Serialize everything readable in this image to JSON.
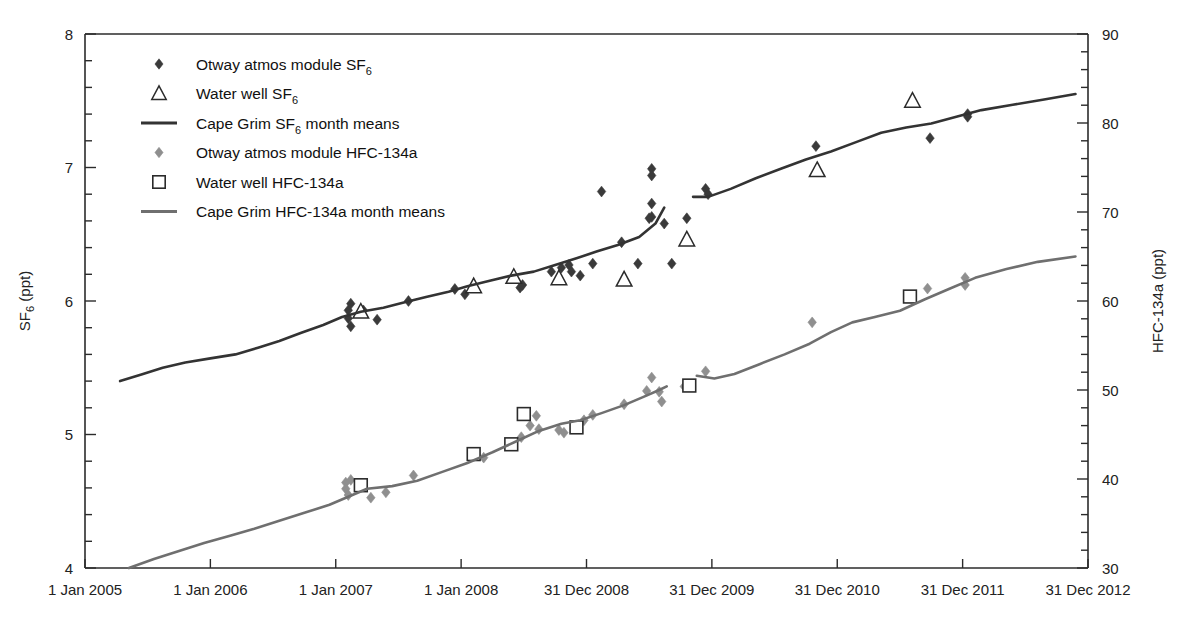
{
  "chart_data": {
    "type": "scatter",
    "title": "",
    "xlabel": "",
    "ylabel": "SF_6 (ppt)",
    "y2label": "HFC-134a (ppt)",
    "grid": false,
    "legend_position": "top-left-inside",
    "x_axis": {
      "tick_labels": [
        "1 Jan 2005",
        "1 Jan 2006",
        "1 Jan 2007",
        "1 Jan 2008",
        "31 Dec 2008",
        "31 Dec 2009",
        "31 Dec 2010",
        "31 Dec 2011",
        "31 Dec 2012"
      ],
      "tick_values": [
        2005.0,
        2006.0,
        2007.0,
        2008.0,
        2009.0,
        2010.0,
        2011.0,
        2012.0,
        2013.0
      ],
      "range": [
        2005.0,
        2013.0
      ]
    },
    "y_left": {
      "label": "SF6 (ppt)",
      "label_main": "SF",
      "label_sub": "6",
      "label_unit": " (ppt)",
      "range": [
        4,
        8
      ],
      "major_ticks": [
        4,
        5,
        6,
        7,
        8
      ],
      "major_tick_labels": [
        "4",
        "5",
        "6",
        "7",
        "8"
      ],
      "minor_tick_step": 0.2
    },
    "y_right": {
      "label": "HFC-134a (ppt)",
      "range": [
        30,
        90
      ],
      "major_ticks": [
        30,
        40,
        50,
        60,
        70,
        80,
        90
      ],
      "major_tick_labels": [
        "30",
        "40",
        "50",
        "60",
        "70",
        "80",
        "90"
      ],
      "minor_tick_step": 2
    },
    "colors": {
      "sf6_dark": "#3a3a3a",
      "hfc_gray": "#8a8a8a",
      "axis": "#2b2b2b",
      "background": "#ffffff"
    },
    "series": [
      {
        "name": "Otway atmos module SF6",
        "legend_main": "Otway atmos module SF",
        "legend_sub": "6",
        "legend_tail": "",
        "marker": "filled-diamond",
        "color": "#3a3a3a",
        "axis": "left",
        "points": [
          {
            "x": 2007.1,
            "y": 5.93
          },
          {
            "x": 2007.1,
            "y": 5.87
          },
          {
            "x": 2007.12,
            "y": 5.98
          },
          {
            "x": 2007.12,
            "y": 5.81
          },
          {
            "x": 2007.22,
            "y": 5.93
          },
          {
            "x": 2007.33,
            "y": 5.86
          },
          {
            "x": 2007.58,
            "y": 6.0
          },
          {
            "x": 2007.95,
            "y": 6.09
          },
          {
            "x": 2008.03,
            "y": 6.05
          },
          {
            "x": 2008.47,
            "y": 6.1
          },
          {
            "x": 2008.49,
            "y": 6.12
          },
          {
            "x": 2008.72,
            "y": 6.22
          },
          {
            "x": 2008.8,
            "y": 6.25
          },
          {
            "x": 2008.86,
            "y": 6.27
          },
          {
            "x": 2008.88,
            "y": 6.22
          },
          {
            "x": 2008.95,
            "y": 6.19
          },
          {
            "x": 2009.05,
            "y": 6.28
          },
          {
            "x": 2009.12,
            "y": 6.82
          },
          {
            "x": 2009.28,
            "y": 6.44
          },
          {
            "x": 2009.41,
            "y": 6.28
          },
          {
            "x": 2009.52,
            "y": 6.99
          },
          {
            "x": 2009.52,
            "y": 6.94
          },
          {
            "x": 2009.52,
            "y": 6.73
          },
          {
            "x": 2009.52,
            "y": 6.63
          },
          {
            "x": 2009.5,
            "y": 6.62
          },
          {
            "x": 2009.62,
            "y": 6.58
          },
          {
            "x": 2009.68,
            "y": 6.28
          },
          {
            "x": 2009.8,
            "y": 6.62
          },
          {
            "x": 2009.95,
            "y": 6.84
          },
          {
            "x": 2009.97,
            "y": 6.8
          },
          {
            "x": 2010.83,
            "y": 7.16
          },
          {
            "x": 2011.74,
            "y": 7.22
          },
          {
            "x": 2012.04,
            "y": 7.4
          },
          {
            "x": 2012.04,
            "y": 7.38
          }
        ]
      },
      {
        "name": "Water well SF6",
        "legend_main": "Water well SF",
        "legend_sub": "6",
        "legend_tail": "",
        "marker": "open-triangle",
        "color": "#2b2b2b",
        "axis": "left",
        "points": [
          {
            "x": 2007.2,
            "y": 5.92
          },
          {
            "x": 2008.1,
            "y": 6.11
          },
          {
            "x": 2008.42,
            "y": 6.18
          },
          {
            "x": 2008.78,
            "y": 6.17
          },
          {
            "x": 2009.3,
            "y": 6.16
          },
          {
            "x": 2009.8,
            "y": 6.46
          },
          {
            "x": 2010.84,
            "y": 6.98
          },
          {
            "x": 2011.6,
            "y": 7.5
          }
        ]
      },
      {
        "name": "Cape Grim SF6 month means",
        "legend_main": "Cape Grim SF",
        "legend_sub": "6",
        "legend_tail": " month means",
        "marker": "line",
        "color": "#333333",
        "axis": "left",
        "segments": [
          {
            "x": [
              2005.28,
              2005.45,
              2005.62,
              2005.8,
              2006.0,
              2006.2,
              2006.38,
              2006.55,
              2006.72,
              2006.9,
              2007.05,
              2007.2,
              2007.38,
              2007.55,
              2007.72,
              2007.9,
              2008.05,
              2008.22,
              2008.4,
              2008.58,
              2008.75,
              2008.92,
              2009.08,
              2009.25,
              2009.42,
              2009.55,
              2009.62
            ],
            "y": [
              5.4,
              5.45,
              5.5,
              5.54,
              5.57,
              5.6,
              5.65,
              5.7,
              5.76,
              5.82,
              5.88,
              5.92,
              5.95,
              5.99,
              6.03,
              6.07,
              6.11,
              6.15,
              6.19,
              6.22,
              6.27,
              6.32,
              6.37,
              6.42,
              6.48,
              6.58,
              6.7
            ]
          },
          {
            "x": [
              2009.85,
              2009.97,
              2010.15,
              2010.35,
              2010.55,
              2010.75,
              2010.95,
              2011.15,
              2011.35,
              2011.55,
              2011.75,
              2011.95,
              2012.15,
              2012.4,
              2012.65,
              2012.9
            ],
            "y": [
              6.78,
              6.78,
              6.84,
              6.92,
              6.99,
              7.06,
              7.12,
              7.19,
              7.26,
              7.3,
              7.33,
              7.38,
              7.43,
              7.47,
              7.51,
              7.55
            ]
          }
        ]
      },
      {
        "name": "Otway atmos module HFC-134a",
        "legend_main": "Otway atmos module HFC-134a",
        "legend_sub": "",
        "legend_tail": "",
        "marker": "filled-diamond",
        "color": "#8f8f8f",
        "axis": "right",
        "points": [
          {
            "x": 2007.08,
            "y": 39.6
          },
          {
            "x": 2007.08,
            "y": 38.9
          },
          {
            "x": 2007.1,
            "y": 38.2
          },
          {
            "x": 2007.12,
            "y": 39.9
          },
          {
            "x": 2007.28,
            "y": 37.9
          },
          {
            "x": 2007.4,
            "y": 38.5
          },
          {
            "x": 2007.62,
            "y": 40.4
          },
          {
            "x": 2008.18,
            "y": 42.4
          },
          {
            "x": 2008.48,
            "y": 44.7
          },
          {
            "x": 2008.55,
            "y": 46.0
          },
          {
            "x": 2008.6,
            "y": 47.1
          },
          {
            "x": 2008.62,
            "y": 45.6
          },
          {
            "x": 2008.78,
            "y": 45.5
          },
          {
            "x": 2008.82,
            "y": 45.2
          },
          {
            "x": 2008.98,
            "y": 46.6
          },
          {
            "x": 2009.05,
            "y": 47.2
          },
          {
            "x": 2009.3,
            "y": 48.4
          },
          {
            "x": 2009.48,
            "y": 49.9
          },
          {
            "x": 2009.52,
            "y": 51.4
          },
          {
            "x": 2009.58,
            "y": 49.8
          },
          {
            "x": 2009.6,
            "y": 48.7
          },
          {
            "x": 2009.78,
            "y": 50.4
          },
          {
            "x": 2009.95,
            "y": 52.1
          },
          {
            "x": 2010.8,
            "y": 57.6
          },
          {
            "x": 2011.72,
            "y": 61.4
          },
          {
            "x": 2012.02,
            "y": 62.6
          },
          {
            "x": 2012.02,
            "y": 61.8
          }
        ]
      },
      {
        "name": "Water well HFC-134a",
        "legend_main": "Water well HFC-134a",
        "legend_sub": "",
        "legend_tail": "",
        "marker": "open-square",
        "color": "#2b2b2b",
        "axis": "right",
        "points": [
          {
            "x": 2007.2,
            "y": 39.3
          },
          {
            "x": 2008.1,
            "y": 42.8
          },
          {
            "x": 2008.4,
            "y": 43.9
          },
          {
            "x": 2008.5,
            "y": 47.3
          },
          {
            "x": 2008.92,
            "y": 45.8
          },
          {
            "x": 2009.82,
            "y": 50.5
          },
          {
            "x": 2011.58,
            "y": 60.5
          }
        ]
      },
      {
        "name": "Cape Grim HFC-134a month means",
        "legend_main": "Cape Grim HFC-134a month means",
        "legend_sub": "",
        "legend_tail": "",
        "marker": "line",
        "color": "#6f6f6f",
        "axis": "right",
        "segments": [
          {
            "x": [
              2005.35,
              2005.55,
              2005.75,
              2005.95,
              2006.15,
              2006.35,
              2006.55,
              2006.75,
              2006.95,
              2007.1,
              2007.25,
              2007.45,
              2007.65,
              2007.85,
              2008.05,
              2008.25,
              2008.45,
              2008.62,
              2008.8,
              2008.95,
              2009.12,
              2009.3,
              2009.45,
              2009.58,
              2009.64
            ],
            "y": [
              30.0,
              31.0,
              31.9,
              32.8,
              33.6,
              34.4,
              35.3,
              36.2,
              37.1,
              38.0,
              38.9,
              39.2,
              39.8,
              40.8,
              41.8,
              43.0,
              44.3,
              45.4,
              46.2,
              46.6,
              47.4,
              48.3,
              49.2,
              50.0,
              50.4
            ]
          },
          {
            "x": [
              2009.88,
              2010.02,
              2010.18,
              2010.38,
              2010.58,
              2010.78,
              2010.95,
              2011.12,
              2011.3,
              2011.5,
              2011.7,
              2011.9,
              2012.1,
              2012.35,
              2012.6,
              2012.9
            ],
            "y": [
              51.6,
              51.3,
              51.8,
              52.9,
              54.0,
              55.2,
              56.5,
              57.6,
              58.2,
              58.9,
              60.2,
              61.4,
              62.6,
              63.6,
              64.4,
              65.0
            ]
          }
        ]
      }
    ]
  }
}
